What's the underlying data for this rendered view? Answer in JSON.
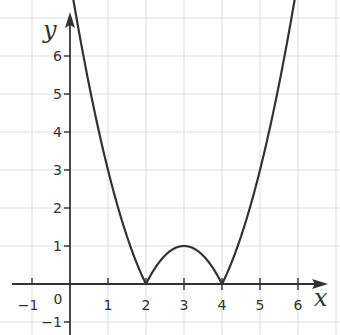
{
  "chart_data": {
    "type": "line",
    "title": "",
    "function": "y = |x^2 - 6x + 8|",
    "xlabel": "x",
    "ylabel": "y",
    "xlim": [
      -1.5,
      7.1
    ],
    "ylim": [
      -1.3,
      7.4
    ],
    "grid": true,
    "x_ticks": [
      -1,
      1,
      2,
      3,
      4,
      5,
      6
    ],
    "x_tick_labels": [
      "−1",
      "1",
      "2",
      "3",
      "4",
      "5",
      "6"
    ],
    "y_ticks": [
      -1,
      1,
      2,
      3,
      4,
      5,
      6
    ],
    "y_tick_labels": [
      "−1",
      "1",
      "2",
      "3",
      "4",
      "5",
      "6"
    ],
    "origin_label": "0",
    "series": [
      {
        "name": "y = |x² − 6x + 8|",
        "color": "#333333",
        "x": [
          0.1,
          0.5,
          1,
          1.5,
          2,
          2.5,
          3,
          3.5,
          4,
          4.5,
          5,
          5.5,
          5.9
        ],
        "y": [
          7.41,
          5.25,
          3,
          1.25,
          0,
          0.75,
          1,
          0.75,
          0,
          1.25,
          3,
          5.25,
          7.41
        ]
      }
    ],
    "key_points": [
      {
        "x": 2,
        "y": 0,
        "label": "root"
      },
      {
        "x": 3,
        "y": 1,
        "label": "local max"
      },
      {
        "x": 4,
        "y": 0,
        "label": "root"
      }
    ]
  },
  "layout": {
    "origin_px": [
      70,
      284
    ],
    "unit_px": 38,
    "grid_color": "#dddddd",
    "axis_color": "#333333",
    "curve_color": "#333333"
  },
  "labels": {
    "x_axis": "x",
    "y_axis": "y",
    "origin": "0",
    "x_ticks": [
      "−1",
      "1",
      "2",
      "3",
      "4",
      "5",
      "6"
    ],
    "y_ticks": [
      "6",
      "5",
      "4",
      "3",
      "2",
      "1",
      "−1"
    ]
  }
}
